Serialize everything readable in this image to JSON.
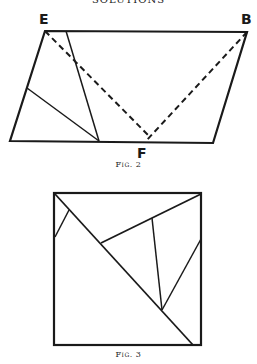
{
  "page": {
    "running_header": "SOLUTIONS"
  },
  "figures": [
    {
      "id": "fig2",
      "caption": "Fig. 2",
      "point_labels": {
        "E": "E",
        "B": "B",
        "F": "F"
      }
    },
    {
      "id": "fig3",
      "caption": "Fig. 3"
    }
  ]
}
